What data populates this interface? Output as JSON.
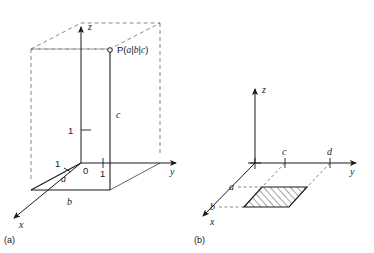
{
  "figure": {
    "background_color": "#ffffff",
    "line_color": "#1a1a1a",
    "dash_color": "#555555",
    "panels": [
      {
        "caption": "(a)",
        "description": "Point P in a rectangular box in 3D coordinate system",
        "axes": [
          {
            "name": "x-axis",
            "label": "x"
          },
          {
            "name": "y-axis",
            "label": "y"
          },
          {
            "name": "z-axis",
            "label": "z"
          }
        ],
        "point_label": {
          "prefix": "P(",
          "a": "a",
          "sep1": "|",
          "b": "b",
          "sep2": "|",
          "c": "c",
          "suffix": ")"
        },
        "tick_labels": {
          "x_one": "1",
          "y_one": "1",
          "z_one": "1",
          "origin": "0"
        },
        "edge_labels": {
          "a": "a",
          "b": "b",
          "c": "c"
        }
      },
      {
        "caption": "(b)",
        "description": "Hatched parallelogram region bounded by a, b on x-axis and c, d on y-axis",
        "axes": [
          {
            "name": "x-axis",
            "label": "x"
          },
          {
            "name": "y-axis",
            "label": "y"
          },
          {
            "name": "z-axis",
            "label": "z"
          }
        ],
        "bound_labels": {
          "a": "a",
          "b": "b",
          "c": "c",
          "d": "d"
        }
      }
    ]
  }
}
